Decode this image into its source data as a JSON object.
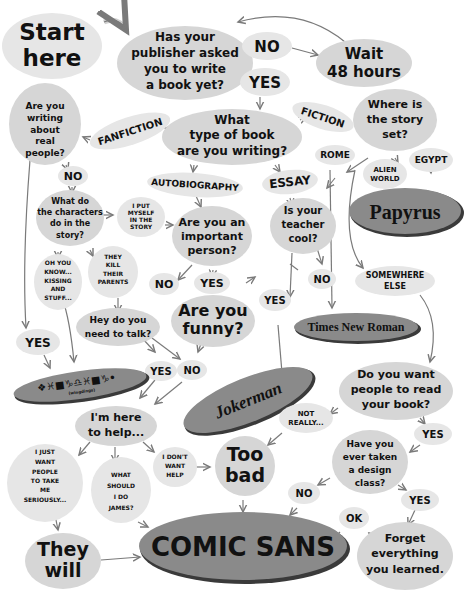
{
  "title_fragment": "",
  "nodes": {
    "start": [
      "Start",
      "here"
    ],
    "publisher": [
      "Has your",
      "publisher asked",
      "you to write",
      "a book yet?"
    ],
    "pub_no": "NO",
    "pub_yes": "YES",
    "wait": [
      "Wait",
      "48 hours"
    ],
    "type": [
      "What",
      "type of book",
      "are you writing?"
    ],
    "fanfiction": "FANFICTION",
    "fiction": "FICTION",
    "autobiography": "AUTOBIOGRAPHY",
    "essay": "ESSAY",
    "real_people": [
      "Are you",
      "writing",
      "about",
      "real",
      "people?"
    ],
    "real_no": "NO",
    "real_yes": "YES",
    "characters": [
      "What do",
      "the characters",
      "do in the",
      "story?"
    ],
    "put_myself": [
      "I PUT",
      "MYSELF",
      "IN THE",
      "STORY"
    ],
    "kissing": [
      "OH YOU",
      "KNOW...",
      "KISSING",
      "AND",
      "STUFF..."
    ],
    "kill_parents": [
      "THEY",
      "KILL",
      "THEIR",
      "PARENTS"
    ],
    "important": [
      "Are you an",
      "important",
      "person?"
    ],
    "imp_no": "NO",
    "imp_yes": "YES",
    "funny": [
      "Are you",
      "funny?"
    ],
    "talk": [
      "Hey do you",
      "need to talk?"
    ],
    "talk_yes": "YES",
    "talk_no": "NO",
    "wingdings": "❖♓■♑♎♓■♑•",
    "wingdings_note": "(wingdings)",
    "teacher": [
      "Is your",
      "teacher",
      "cool?"
    ],
    "teacher_yes": "YES",
    "teacher_no": "NO",
    "where": [
      "Where is",
      "the story",
      "set?"
    ],
    "rome": "ROME",
    "alien": [
      "ALIEN",
      "WORLD"
    ],
    "egypt": "EGYPT",
    "papyrus": "Papyrus",
    "somewhere": [
      "SOMEWHERE",
      "ELSE"
    ],
    "tnr": "Times New Roman",
    "jokerman": "Jokerman",
    "read": [
      "Do you want",
      "people to read",
      "your book?"
    ],
    "not_really": [
      "NOT",
      "REALLY..."
    ],
    "read_yes": "YES",
    "design": [
      "Have you",
      "ever taken",
      "a design",
      "class?"
    ],
    "design_no": "NO",
    "design_yes": "YES",
    "forget": [
      "Forget",
      "everything",
      "you learned."
    ],
    "ok": "OK",
    "help": [
      "I'm here",
      "to help..."
    ],
    "seriously": [
      "I JUST",
      "WANT",
      "PEOPLE",
      "TO TAKE",
      "ME",
      "SERIOUSLY..."
    ],
    "james": [
      "WHAT",
      "SHOULD",
      "I DO",
      "JAMES?"
    ],
    "dont_want": [
      "I DON'T",
      "WANT",
      "HELP"
    ],
    "too_bad": [
      "Too",
      "bad"
    ],
    "they_will": [
      "They",
      "will"
    ],
    "comic_sans": "COMIC SANS"
  },
  "colors": {
    "node_fill": "#d6d6d6",
    "result_fill": "#8a8a8a",
    "arrow": "#7a7a7a",
    "text": "#111111"
  }
}
